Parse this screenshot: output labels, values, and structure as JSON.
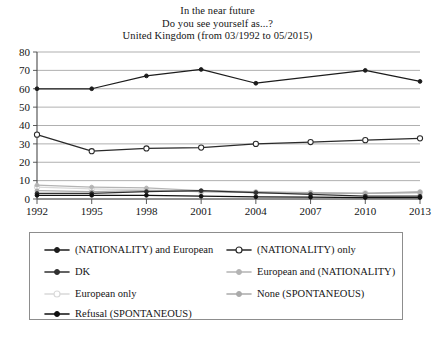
{
  "chart_data": {
    "type": "line",
    "title": "In the near future\nDo you see yourself as...?\nUnited Kingdom (from 03/1992 to 05/2015)",
    "title_lines": [
      "In the near future",
      "Do you see yourself as...?",
      "United Kingdom (from 03/1992 to 05/2015)"
    ],
    "xlabel": "",
    "ylabel": "",
    "categories": [
      "1992",
      "1995",
      "1998",
      "2001",
      "2004",
      "2007",
      "2010",
      "2013"
    ],
    "x_tick_labels": [
      "1992",
      "1995",
      "1998",
      "2001",
      "2004",
      "2007",
      "2010",
      "2013"
    ],
    "y_tick_labels": [
      "0",
      "10",
      "20",
      "30",
      "40",
      "50",
      "60",
      "70",
      "80"
    ],
    "ylim": [
      0,
      80
    ],
    "y_tick_step": 10,
    "grid": true,
    "grid_axis": "y",
    "legend_position": "below",
    "legend_columns": 2,
    "series": [
      {
        "name": "(NATIONALITY) and European",
        "color": "#1c1c1c",
        "marker": "filled-circle",
        "values": [
          60,
          60,
          67,
          70.5,
          63,
          null,
          70,
          64
        ]
      },
      {
        "name": "(NATIONALITY) only",
        "color": "#2a2a2a",
        "marker": "open-circle",
        "values": [
          35,
          26,
          27.5,
          28,
          30,
          31,
          32,
          33
        ]
      },
      {
        "name": "DK",
        "color": "#303030",
        "marker": "filled-circle",
        "values": [
          3,
          3,
          4,
          4.5,
          3.5,
          2.5,
          1.5,
          1.5
        ]
      },
      {
        "name": "European and (NATIONALITY)",
        "color": "#b4b4b4",
        "marker": "filled-circle",
        "values": [
          7.5,
          6.5,
          6,
          4.5,
          4,
          3.5,
          3,
          4
        ]
      },
      {
        "name": "European only",
        "color": "#d9d9d9",
        "marker": "open-circle",
        "values": [
          6.5,
          5.5,
          5,
          4,
          3.5,
          3.2,
          3,
          3.5
        ]
      },
      {
        "name": "None (SPONTANEOUS)",
        "color": "#aaaaaa",
        "marker": "filled-circle",
        "values": [
          4.5,
          4,
          4.5,
          4,
          3.5,
          3.2,
          3,
          3.5
        ]
      },
      {
        "name": "Refusal (SPONTANEOUS)",
        "color": "#111111",
        "marker": "filled-circle",
        "values": [
          2,
          2,
          2,
          1.5,
          1.2,
          1,
          0.8,
          0.8
        ]
      }
    ]
  },
  "legend": {
    "entries": [
      {
        "label": "(NATIONALITY) and European",
        "color": "#1c1c1c",
        "marker": "filled-circle",
        "column": "left",
        "row": 0
      },
      {
        "label": "(NATIONALITY) only",
        "color": "#2a2a2a",
        "marker": "open-circle",
        "column": "right",
        "row": 0
      },
      {
        "label": "DK",
        "color": "#303030",
        "marker": "filled-circle",
        "column": "left",
        "row": 1
      },
      {
        "label": "European and (NATIONALITY)",
        "color": "#b4b4b4",
        "marker": "filled-circle",
        "column": "right",
        "row": 1
      },
      {
        "label": "European only",
        "color": "#d9d9d9",
        "marker": "open-circle",
        "column": "left",
        "row": 2
      },
      {
        "label": "None (SPONTANEOUS)",
        "color": "#aaaaaa",
        "marker": "filled-circle",
        "column": "right",
        "row": 2
      },
      {
        "label": "Refusal (SPONTANEOUS)",
        "color": "#111111",
        "marker": "filled-circle",
        "column": "left",
        "row": 3
      }
    ]
  },
  "colors": {
    "axis": "#4a4a4a",
    "grid": "#8e8e8e",
    "text": "#141414",
    "background": "#ffffff"
  }
}
